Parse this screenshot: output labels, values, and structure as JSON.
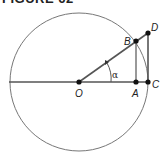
{
  "title": "FIGURE 62",
  "diagram": {
    "type": "unit-circle-trig",
    "colors": {
      "line": "#555555",
      "point": "#111111",
      "circle": "#777777"
    },
    "points": {
      "O": {
        "label": "O",
        "x": 79,
        "y": 82
      },
      "A": {
        "label": "A",
        "x": 136,
        "y": 82
      },
      "C": {
        "label": "C",
        "x": 148,
        "y": 82
      },
      "B": {
        "label": "B",
        "x": 136,
        "y": 41
      },
      "D": {
        "label": "D",
        "x": 148,
        "y": 33
      }
    },
    "angle_label": "α",
    "circle": {
      "cx": 79,
      "cy": 82,
      "r": 69
    }
  }
}
